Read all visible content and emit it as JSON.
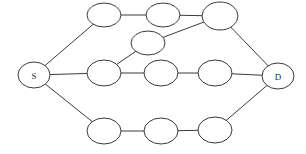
{
  "diagram": {
    "type": "undirected-graph",
    "canvas": {
      "width": 306,
      "height": 154,
      "background": "#ffffff"
    },
    "style": {
      "stroke_color": "#3a3a3a",
      "stroke_width": 1,
      "node_fill": "#ffffff",
      "label_color": "#2b2b2b",
      "label_font_size": 9
    },
    "nodes": [
      {
        "id": "S",
        "label": "S",
        "cx": 34,
        "cy": 75,
        "rx": 16,
        "ry": 13,
        "name": "node-source-s"
      },
      {
        "id": "T1",
        "label": "",
        "cx": 104,
        "cy": 15,
        "rx": 17,
        "ry": 12,
        "name": "node-top-1"
      },
      {
        "id": "T2",
        "label": "",
        "cx": 163,
        "cy": 15,
        "rx": 17,
        "ry": 12,
        "name": "node-top-2"
      },
      {
        "id": "T3",
        "label": "",
        "cx": 220,
        "cy": 16,
        "rx": 18,
        "ry": 14,
        "name": "node-top-3"
      },
      {
        "id": "U1",
        "label": "",
        "cx": 148,
        "cy": 43,
        "rx": 17,
        "ry": 12,
        "name": "node-upper-middle-1"
      },
      {
        "id": "M1",
        "label": "",
        "cx": 104,
        "cy": 73,
        "rx": 17,
        "ry": 13,
        "name": "node-middle-1"
      },
      {
        "id": "M2",
        "label": "",
        "cx": 161,
        "cy": 73,
        "rx": 17,
        "ry": 13,
        "name": "node-middle-2"
      },
      {
        "id": "M3",
        "label": "",
        "cx": 215,
        "cy": 73,
        "rx": 17,
        "ry": 13,
        "name": "node-middle-3"
      },
      {
        "id": "B1",
        "label": "",
        "cx": 104,
        "cy": 131,
        "rx": 17,
        "ry": 13,
        "name": "node-bottom-1"
      },
      {
        "id": "B2",
        "label": "",
        "cx": 161,
        "cy": 131,
        "rx": 17,
        "ry": 13,
        "name": "node-bottom-2"
      },
      {
        "id": "B3",
        "label": "",
        "cx": 215,
        "cy": 130,
        "rx": 17,
        "ry": 13,
        "name": "node-bottom-3"
      },
      {
        "id": "D",
        "label": "D",
        "cx": 278,
        "cy": 76,
        "rx": 16,
        "ry": 13,
        "name": "node-destination-d"
      }
    ],
    "edges": [
      {
        "from": "S",
        "to": "T1",
        "name": "edge-s-top1"
      },
      {
        "from": "S",
        "to": "M1",
        "name": "edge-s-middle1"
      },
      {
        "from": "S",
        "to": "B1",
        "name": "edge-s-bottom1"
      },
      {
        "from": "T1",
        "to": "T2",
        "name": "edge-top1-top2"
      },
      {
        "from": "T2",
        "to": "T3",
        "name": "edge-top2-top3"
      },
      {
        "from": "T3",
        "to": "U1",
        "name": "edge-top3-uppermiddle1"
      },
      {
        "from": "T3",
        "to": "D",
        "name": "edge-top3-d"
      },
      {
        "from": "U1",
        "to": "M1",
        "name": "edge-uppermiddle1-middle1"
      },
      {
        "from": "M1",
        "to": "M2",
        "name": "edge-middle1-middle2"
      },
      {
        "from": "M2",
        "to": "M3",
        "name": "edge-middle2-middle3"
      },
      {
        "from": "M3",
        "to": "D",
        "name": "edge-middle3-d"
      },
      {
        "from": "B1",
        "to": "B2",
        "name": "edge-bottom1-bottom2"
      },
      {
        "from": "B2",
        "to": "B3",
        "name": "edge-bottom2-bottom3"
      },
      {
        "from": "B3",
        "to": "D",
        "name": "edge-bottom3-d"
      }
    ]
  }
}
